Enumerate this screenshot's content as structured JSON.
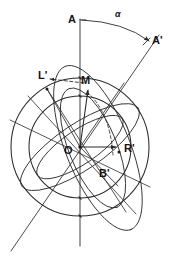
{
  "figure": {
    "stroke_color": "#2b2b2b",
    "label_color": "#141414",
    "background": "#ffffff",
    "center": {
      "x": 80,
      "y": 147
    }
  },
  "labels": {
    "axis_top": "A",
    "axis_tilted": "A'",
    "angle": "α",
    "left_point": "L'",
    "meridian_point": "M",
    "origin": "O",
    "bottom_point": "B'",
    "right_point": "R'"
  },
  "geometry": {
    "outer_circle": {
      "cx": 80,
      "cy": 147,
      "r": 69
    },
    "inner_circle": {
      "cx": 80,
      "cy": 147,
      "r": 51
    },
    "vertical_axis": {
      "x": 80,
      "y1": 18,
      "y2": 245
    },
    "tilted_axis": {
      "x1": 12,
      "y1": 250,
      "x2": 158,
      "y2": 36,
      "tilt_deg": 34
    },
    "angle_arc": {
      "from": "A",
      "to": "A'",
      "value_label": "α"
    },
    "outer_ellipse": {
      "cx": 80,
      "cy": 147,
      "rx": 70,
      "ry": 23,
      "rotate_deg": -34
    },
    "inner_ellipse": {
      "cx": 80,
      "cy": 147,
      "rx": 51,
      "ry": 17,
      "rotate_deg": -34
    },
    "large_tilted_ellipse": {
      "cx": 98,
      "cy": 148,
      "rx": 88,
      "ry": 32,
      "rotate_deg": 68
    },
    "small_tilted_ellipse": {
      "cx": 93,
      "cy": 148,
      "rx": 64,
      "ry": 24,
      "rotate_deg": 68
    },
    "vectors": [
      {
        "name": "O-to-M",
        "from": "O",
        "to": "M",
        "style": "arrow"
      },
      {
        "name": "L'-to-M",
        "from": "M",
        "to": "L'",
        "style": "dashed-arrow"
      },
      {
        "name": "O-to-R'",
        "from": "O",
        "to": "R'",
        "style": "arrow"
      },
      {
        "name": "O-to-B'",
        "from": "O",
        "to": "B'",
        "style": "line"
      },
      {
        "name": "M-to-B'-arc",
        "from": "M",
        "to": "B'",
        "style": "dashed-arc"
      }
    ],
    "marked_points": [
      {
        "name": "L'",
        "x": 47,
        "y": 89
      },
      {
        "name": "R'",
        "x": 119,
        "y": 152
      }
    ]
  }
}
